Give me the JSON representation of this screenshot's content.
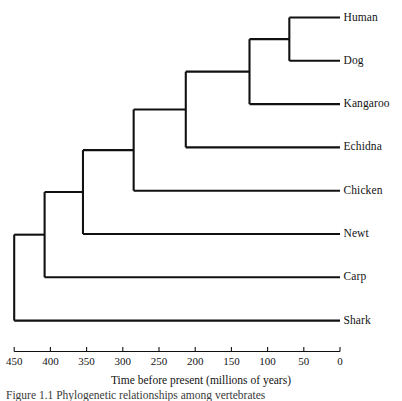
{
  "figure": {
    "type": "phylogenetic-tree-cladogram",
    "axis_title": "Time before present (millions of years)",
    "caption": "Figure 1.1   Phylogenetic relationships among vertebrates",
    "line_color": "#111111",
    "background_color": "#ffffff"
  },
  "axis": {
    "min": 0,
    "max": 450,
    "direction": "reversed",
    "tick_values": [
      450,
      400,
      350,
      300,
      250,
      200,
      150,
      100,
      50,
      0
    ],
    "tick_labels": [
      "450",
      "400",
      "350",
      "300",
      "250",
      "200",
      "150",
      "100",
      "50",
      "0"
    ],
    "units": "millions of years",
    "title": "Time before present (millions of years)"
  },
  "tips": [
    {
      "label": "Human",
      "row": 0,
      "time": 0
    },
    {
      "label": "Dog",
      "row": 1,
      "time": 0
    },
    {
      "label": "Kangaroo",
      "row": 2,
      "time": 0
    },
    {
      "label": "Echidna",
      "row": 3,
      "time": 0
    },
    {
      "label": "Chicken",
      "row": 4,
      "time": 0
    },
    {
      "label": "Newt",
      "row": 5,
      "time": 0
    },
    {
      "label": "Carp",
      "row": 6,
      "time": 0
    },
    {
      "label": "Shark",
      "row": 7,
      "time": 0
    }
  ],
  "nodes": [
    {
      "name": "human-dog",
      "time": 70,
      "children_rows": [
        0,
        1
      ]
    },
    {
      "name": "theria",
      "time": 125,
      "children_rows": [
        0.5,
        2
      ]
    },
    {
      "name": "mammalia",
      "time": 213,
      "children_rows": [
        1.25,
        3
      ]
    },
    {
      "name": "amniota",
      "time": 285,
      "children_rows": [
        2.125,
        4
      ]
    },
    {
      "name": "tetrapoda",
      "time": 355,
      "children_rows": [
        3.0625,
        5
      ]
    },
    {
      "name": "osteichthyes",
      "time": 408,
      "children_rows": [
        4.03,
        6
      ]
    },
    {
      "name": "root",
      "time": 450,
      "children_rows": [
        5.0,
        7
      ]
    }
  ],
  "chart_data": {
    "type": "tree",
    "title": "",
    "xlabel": "Time before present (millions of years)",
    "ylabel": "",
    "xlim": [
      450,
      0
    ],
    "grid": false,
    "legend": "none",
    "taxa": [
      "Human",
      "Dog",
      "Kangaroo",
      "Echidna",
      "Chicken",
      "Newt",
      "Carp",
      "Shark"
    ],
    "tick_labels": [
      "450",
      "400",
      "350",
      "300",
      "250",
      "200",
      "150",
      "100",
      "50",
      "0"
    ],
    "divergence_times_mya": {
      "Human-Dog": 70,
      "(Human,Dog)-Kangaroo": 125,
      "Theria-Echidna": 213,
      "Mammalia-Chicken": 285,
      "Amniota-Newt": 355,
      "Tetrapoda-Carp": 408,
      "Osteichthyes-Shark": 450
    },
    "newick": "(((((((Human:70,Dog:70):55,Kangaroo:125):88,Echidna:213):72,Chicken:285):70,Newt:355):53,Carp:408):42,Shark:450);"
  }
}
